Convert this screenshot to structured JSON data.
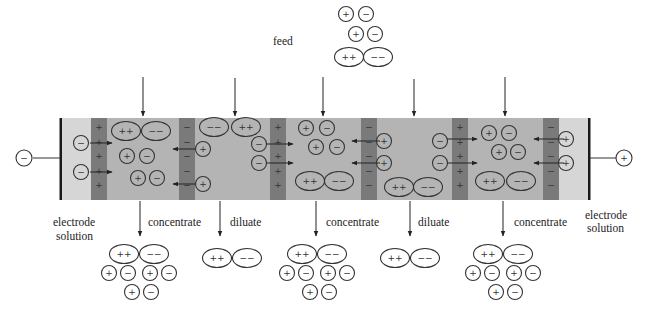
{
  "diagram": {
    "labels": {
      "feed": "feed",
      "electrode_solution_line1": "electrode",
      "electrode_solution_line2": "solution",
      "concentrate": "concentrate",
      "diluate": "diluate"
    },
    "electrodes": {
      "cathode_symbol": "−",
      "anode_symbol": "+"
    },
    "ion_symbols": {
      "cation": "+",
      "anion": "−",
      "divalent_cation": "++",
      "divalent_anion": "−−"
    },
    "membranes": [
      {
        "type": "cation-exchange",
        "fixed_charge": "+"
      },
      {
        "type": "anion-exchange",
        "fixed_charge": "−"
      },
      {
        "type": "cation-exchange",
        "fixed_charge": "+"
      },
      {
        "type": "anion-exchange",
        "fixed_charge": "−"
      },
      {
        "type": "cation-exchange",
        "fixed_charge": "+"
      },
      {
        "type": "anion-exchange",
        "fixed_charge": "−"
      }
    ],
    "compartments": [
      {
        "name": "electrode solution"
      },
      {
        "name": "concentrate"
      },
      {
        "name": "diluate"
      },
      {
        "name": "concentrate"
      },
      {
        "name": "diluate"
      },
      {
        "name": "concentrate"
      },
      {
        "name": "electrode solution"
      }
    ],
    "outputs": [
      {
        "label": "concentrate",
        "contents": [
          "++",
          "−−",
          "+",
          "−",
          "+",
          "−",
          "+",
          "−"
        ]
      },
      {
        "label": "diluate",
        "contents": [
          "++",
          "−−"
        ]
      },
      {
        "label": "concentrate",
        "contents": [
          "++",
          "−−",
          "+",
          "−",
          "+",
          "−",
          "+",
          "−"
        ]
      },
      {
        "label": "diluate",
        "contents": [
          "++",
          "−−"
        ]
      },
      {
        "label": "concentrate",
        "contents": [
          "++",
          "−−",
          "+",
          "−",
          "+",
          "−",
          "+",
          "−"
        ]
      }
    ],
    "feed_contents": [
      "+",
      "−",
      "+",
      "−",
      "++",
      "−−"
    ],
    "colors": {
      "electrode_zone": "#d6d6d6",
      "compartment": "#b4b4b4",
      "membrane": "#7a7a7a",
      "electrode_plate": "#1a1a1a",
      "ink": "#333333"
    }
  }
}
